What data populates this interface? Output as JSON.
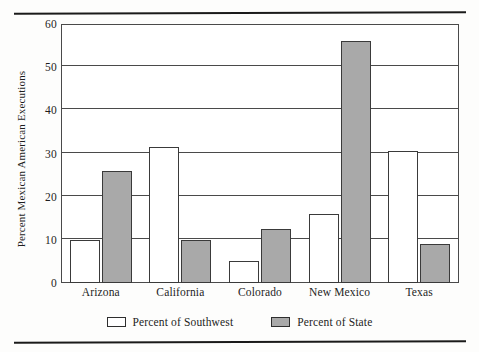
{
  "chart_data": {
    "type": "bar",
    "title": "",
    "xlabel": "",
    "ylabel": "Percent Mexican American Executions",
    "ylim": [
      0,
      60
    ],
    "yticks": [
      0,
      10,
      20,
      30,
      40,
      50,
      60
    ],
    "ytick_labels": [
      "0",
      "10",
      "20",
      "30",
      "40",
      "50",
      "60"
    ],
    "grid": true,
    "legend_position": "bottom-center",
    "categories": [
      "Arizona",
      "California",
      "Colorado",
      "New Mexico",
      "Texas"
    ],
    "series": [
      {
        "name": "Percent of Southwest",
        "color": "#ffffff",
        "values": [
          10,
          31.5,
          5,
          16,
          30.5
        ]
      },
      {
        "name": "Percent of State",
        "color": "#a9a9a9",
        "values": [
          26,
          10,
          12.5,
          56,
          9
        ]
      }
    ]
  },
  "legend": {
    "items": [
      {
        "label": "Percent of Southwest",
        "swatch": "white-swatch"
      },
      {
        "label": "Percent of State",
        "swatch": "gray-swatch"
      }
    ]
  }
}
